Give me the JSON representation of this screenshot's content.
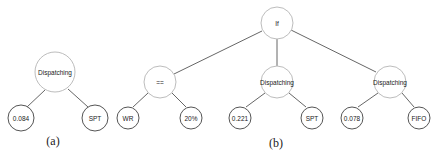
{
  "figure": {
    "trees": [
      {
        "id": "a",
        "caption": "(a)",
        "root": {
          "label": "Dispatching",
          "children": [
            {
              "label": "0.084"
            },
            {
              "label": "SPT"
            }
          ]
        }
      },
      {
        "id": "b",
        "caption": "(b)",
        "root": {
          "label": "If",
          "children": [
            {
              "label": "==",
              "children": [
                {
                  "label": "WR"
                },
                {
                  "label": "20%"
                }
              ]
            },
            {
              "label": "Dispatching",
              "children": [
                {
                  "label": "0.221"
                },
                {
                  "label": "SPT"
                }
              ]
            },
            {
              "label": "Dispatching",
              "children": [
                {
                  "label": "0.078"
                },
                {
                  "label": "FIFO"
                }
              ]
            }
          ]
        }
      }
    ]
  },
  "nodes": {
    "a_root": "Dispatching",
    "a_left": "0.084",
    "a_right": "SPT",
    "a_caption": "(a)",
    "b_root": "If",
    "b_cond": "==",
    "b_cond_left": "WR",
    "b_cond_right": "20%",
    "b_then": "Dispatching",
    "b_then_left": "0.221",
    "b_then_right": "SPT",
    "b_else": "Dispatching",
    "b_else_left": "0.078",
    "b_else_right": "FIFO",
    "b_caption": "(b)"
  },
  "colors": {
    "inner_node_stroke": "#bdbdbd",
    "leaf_node_stroke": "#555555",
    "edge": "#555555",
    "text": "#222222"
  }
}
